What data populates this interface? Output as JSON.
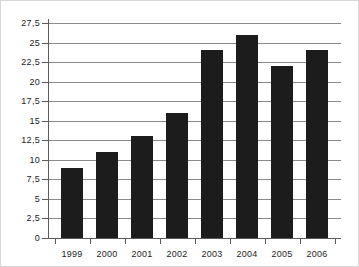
{
  "chart_data": {
    "type": "bar",
    "title": "",
    "subtitle": "",
    "xlabel": "",
    "ylabel": "",
    "categories": [
      "1999",
      "2000",
      "2001",
      "2002",
      "2003",
      "2004",
      "2005",
      "2006"
    ],
    "values": [
      9,
      11,
      13,
      16,
      24,
      26,
      22,
      24
    ],
    "series": [
      {
        "name": "",
        "values": [
          9,
          11,
          13,
          16,
          24,
          26,
          22,
          24
        ]
      }
    ],
    "ylim": [
      0,
      27.5
    ],
    "ytick_values": [
      0,
      2.5,
      5,
      7.5,
      10,
      12.5,
      15,
      17.5,
      20,
      22.5,
      25,
      27.5
    ],
    "ytick_labels": [
      "0",
      "2,5",
      "5",
      "7,5",
      "10",
      "12,5",
      "15",
      "17,5",
      "20",
      "22,5",
      "25",
      "27,5"
    ],
    "decimal_separator": ",",
    "grid": true,
    "grid_axis": "y",
    "legend": false,
    "legend_position": "none",
    "colors": {
      "bar": "#1c1c1c",
      "grid": "#8a8a8a",
      "axis": "#5a5a5a",
      "background": "#ffffff",
      "text": "#1d1d1d",
      "border": "#d8d8d8"
    }
  }
}
